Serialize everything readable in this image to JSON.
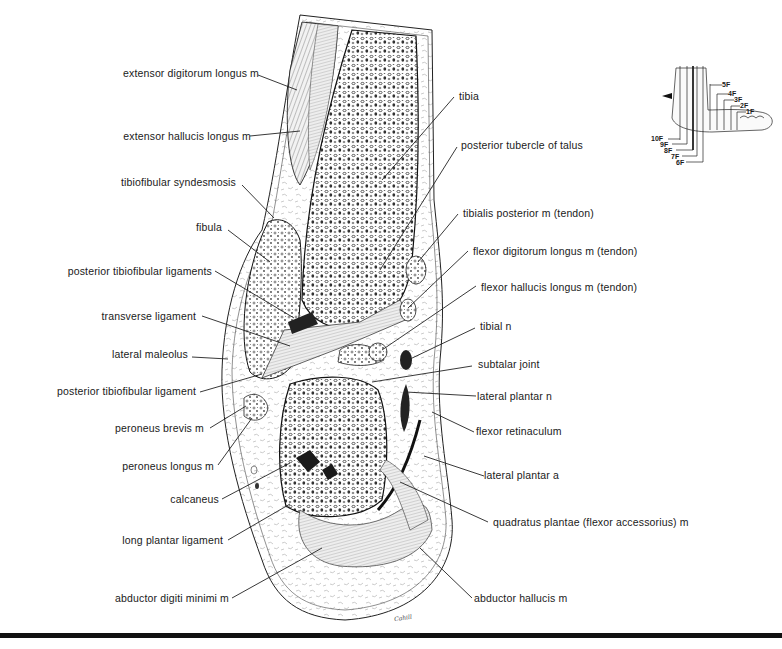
{
  "figure": {
    "signature": "Cahill",
    "labels_left": [
      {
        "id": "extensor-digitorum-longus",
        "text": "extensor digitorum longus m"
      },
      {
        "id": "extensor-hallucis-longus",
        "text": "extensor hallucis longus m"
      },
      {
        "id": "tibiofibular-syndesmosis",
        "text": "tibiofibular syndesmosis"
      },
      {
        "id": "fibula",
        "text": "fibula"
      },
      {
        "id": "posterior-tibiofibular-ligaments",
        "text": "posterior tibiofibular ligaments"
      },
      {
        "id": "transverse-ligament",
        "text": "transverse ligament"
      },
      {
        "id": "lateral-maleolus",
        "text": "lateral maleolus"
      },
      {
        "id": "posterior-tibiofibular-ligament",
        "text": "posterior tibiofibular ligament"
      },
      {
        "id": "peroneus-brevis",
        "text": "peroneus brevis m"
      },
      {
        "id": "peroneus-longus",
        "text": "peroneus longus m"
      },
      {
        "id": "calcaneus",
        "text": "calcaneus"
      },
      {
        "id": "long-plantar-ligament",
        "text": "long plantar ligament"
      },
      {
        "id": "abductor-digiti-minimi",
        "text": "abductor digiti minimi m"
      }
    ],
    "labels_right": [
      {
        "id": "tibia",
        "text": "tibia"
      },
      {
        "id": "posterior-tubercle-of-talus",
        "text": "posterior tubercle of talus"
      },
      {
        "id": "tibialis-posterior",
        "text": "tibialis posterior m (tendon)"
      },
      {
        "id": "flexor-digitorum-longus",
        "text": "flexor digitorum longus m (tendon)"
      },
      {
        "id": "flexor-hallucis-longus",
        "text": "flexor hallucis longus m (tendon)"
      },
      {
        "id": "tibial-n",
        "text": "tibial n"
      },
      {
        "id": "subtalar-joint",
        "text": "subtalar joint"
      },
      {
        "id": "lateral-plantar-n",
        "text": "lateral plantar n"
      },
      {
        "id": "flexor-retinaculum",
        "text": "flexor retinaculum"
      },
      {
        "id": "lateral-plantar-a",
        "text": "lateral plantar a"
      },
      {
        "id": "quadratus-plantae",
        "text": "quadratus plantae (flexor accessorius) m"
      },
      {
        "id": "abductor-hallucis",
        "text": "abductor hallucis m"
      }
    ],
    "inset": {
      "description": "Foot orientation key showing section planes",
      "planes_right": [
        "5F",
        "4F",
        "3F",
        "2F",
        "1F"
      ],
      "planes_left": [
        "10F",
        "9F",
        "8F",
        "7F",
        "6F"
      ],
      "highlighted_plane": "8F"
    }
  }
}
